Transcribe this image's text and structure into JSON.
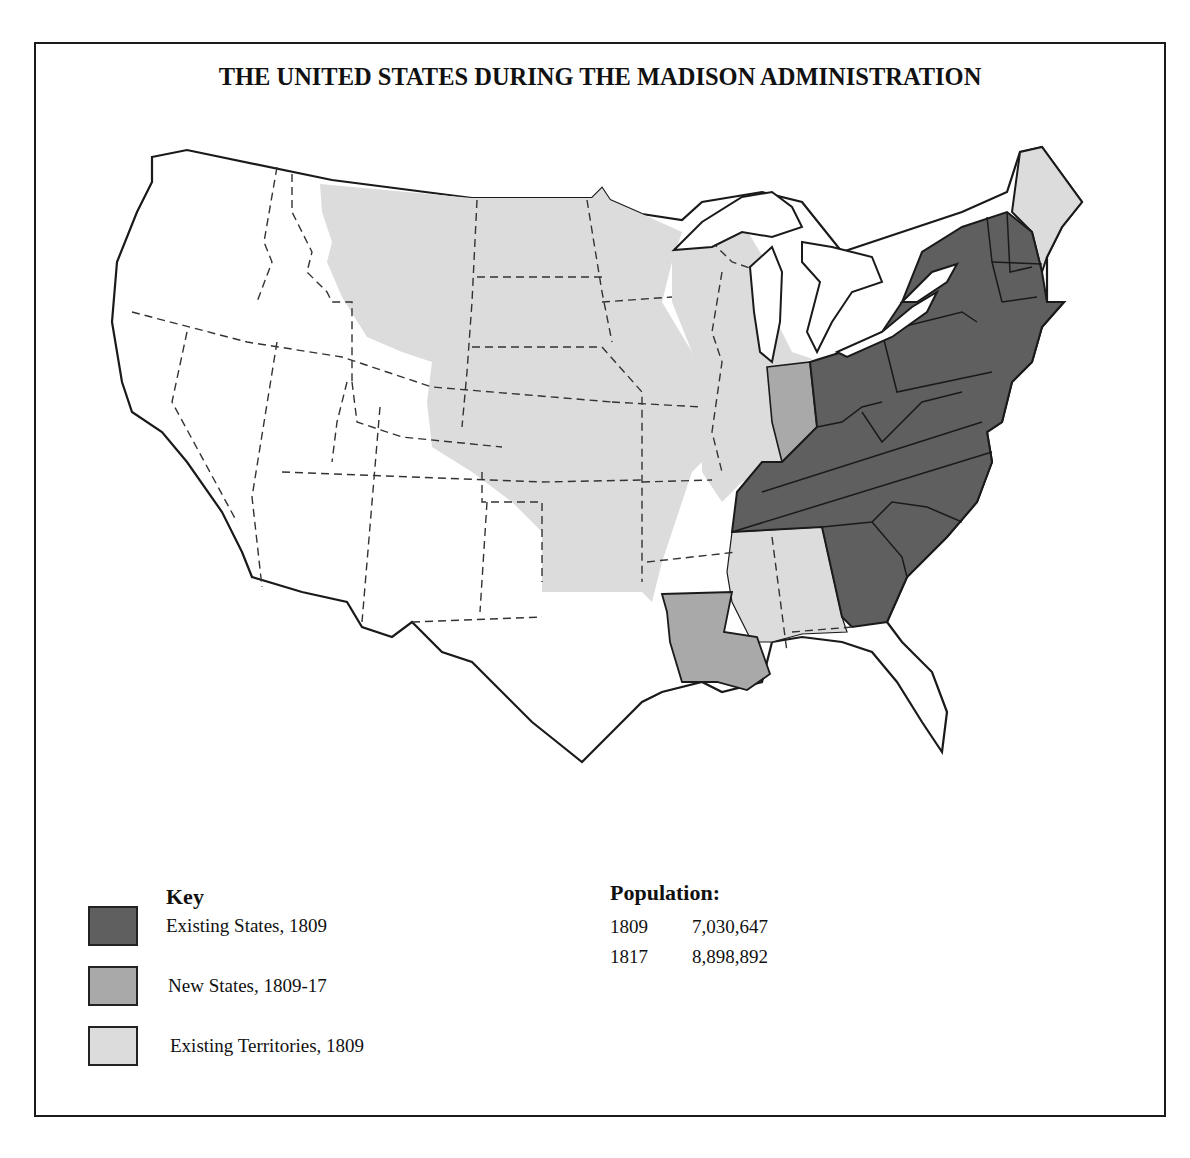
{
  "title": "THE UNITED STATES DURING THE MADISON ADMINISTRATION",
  "colors": {
    "existing_states": "#5f5f5f",
    "new_states": "#a9a9a9",
    "existing_territories": "#dcdcdc",
    "unorganized": "#ffffff",
    "border": "#1a1a1a"
  },
  "key": {
    "title": "Key",
    "items": [
      {
        "label": "Existing States, 1809",
        "color": "#5f5f5f"
      },
      {
        "label": "New States, 1809-17",
        "color": "#a9a9a9"
      },
      {
        "label": "Existing Territories, 1809",
        "color": "#dcdcdc"
      }
    ]
  },
  "population": {
    "title": "Population:",
    "rows": [
      {
        "year": "1809",
        "value": "7,030,647"
      },
      {
        "year": "1817",
        "value": "8,898,892"
      }
    ]
  },
  "map": {
    "existing_states_1809": [
      "New Hampshire",
      "Vermont",
      "Massachusetts",
      "Rhode Island",
      "Connecticut",
      "New York",
      "New Jersey",
      "Pennsylvania",
      "Delaware",
      "Maryland",
      "Virginia",
      "North Carolina",
      "South Carolina",
      "Georgia",
      "Kentucky",
      "Tennessee",
      "Ohio"
    ],
    "new_states_1809_17": [
      "Louisiana",
      "Indiana"
    ],
    "existing_territories_1809": [
      "Louisiana Purchase territory",
      "Michigan",
      "Illinois",
      "Mississippi",
      "Maine (district)"
    ]
  }
}
